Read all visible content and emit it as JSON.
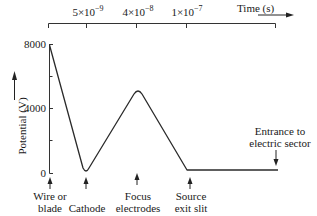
{
  "diagram": {
    "type": "potential-vs-position profile",
    "top_axis": {
      "label": "Time (s)",
      "ticks": [
        {
          "mantissa": "5",
          "times": "×",
          "base": "10",
          "exponent": "−9"
        },
        {
          "mantissa": "4",
          "times": "×",
          "base": "10",
          "exponent": "−8"
        },
        {
          "mantissa": "1",
          "times": "×",
          "base": "10",
          "exponent": "−7"
        }
      ]
    },
    "y_axis": {
      "label": "Potential (V)",
      "ticks": [
        "8000",
        "4000",
        "0"
      ]
    },
    "positions": [
      {
        "line1": "Wire or",
        "line2": "blade"
      },
      {
        "line1": "Cathode",
        "line2": ""
      },
      {
        "line1": "Focus",
        "line2": "electrodes"
      },
      {
        "line1": "Source",
        "line2": "exit slit"
      },
      {
        "line1": "Entrance to",
        "line2": "electric sector"
      }
    ],
    "curve_points_V": [
      {
        "position": "Wire or blade",
        "potential": 8000
      },
      {
        "position": "Cathode",
        "potential": 0
      },
      {
        "position": "Focus electrodes",
        "potential": 5000
      },
      {
        "position": "Source exit slit",
        "potential": 200
      },
      {
        "position": "Entrance to electric sector",
        "potential": 200
      }
    ]
  }
}
